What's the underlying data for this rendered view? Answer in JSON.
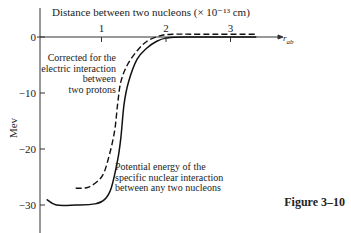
{
  "chart_data": {
    "type": "line",
    "title": "",
    "xlabel": "Distance between two nucleons (× 10⁻¹³ cm)",
    "ylabel": "Mev",
    "x_axis_end_label": "r_ab",
    "xlim": [
      0,
      3.6
    ],
    "ylim": [
      -34,
      2
    ],
    "x_ticks": [
      1,
      2,
      3
    ],
    "x_tick_labels": [
      "1",
      "2",
      "3"
    ],
    "y_ticks": [
      0,
      -10,
      -20,
      -30
    ],
    "y_tick_labels": [
      "0",
      "−10",
      "−20",
      "−30"
    ],
    "grid": false,
    "series": [
      {
        "name": "Potential energy of the specific nuclear interaction between any two nucleons",
        "style": "solid",
        "points": [
          [
            0.15,
            -29
          ],
          [
            0.3,
            -30
          ],
          [
            0.6,
            -30
          ],
          [
            0.9,
            -29.8
          ],
          [
            1.05,
            -29
          ],
          [
            1.15,
            -27
          ],
          [
            1.25,
            -22
          ],
          [
            1.3,
            -18
          ],
          [
            1.35,
            -12
          ],
          [
            1.42,
            -8
          ],
          [
            1.55,
            -4
          ],
          [
            1.7,
            -2
          ],
          [
            1.85,
            -0.8
          ],
          [
            2.0,
            -0.2
          ],
          [
            2.3,
            0
          ],
          [
            3.4,
            0
          ]
        ]
      },
      {
        "name": "Corrected for the electric interaction between two protons",
        "style": "dashed",
        "points": [
          [
            0.6,
            -27
          ],
          [
            0.8,
            -26.8
          ],
          [
            1.0,
            -25
          ],
          [
            1.1,
            -22
          ],
          [
            1.2,
            -17
          ],
          [
            1.25,
            -12
          ],
          [
            1.3,
            -8
          ],
          [
            1.4,
            -5
          ],
          [
            1.55,
            -2.5
          ],
          [
            1.7,
            -0.8
          ],
          [
            1.9,
            0.2
          ],
          [
            2.1,
            0.5
          ],
          [
            2.5,
            0.5
          ],
          [
            3.4,
            0.5
          ]
        ]
      }
    ],
    "annotations": [
      {
        "text_lines": [
          "Corrected for the",
          "electric interaction",
          "between",
          "two protons"
        ],
        "target": "dashed"
      },
      {
        "text_lines": [
          "Potential energy of the",
          "specific nuclear interaction",
          "between any two nucleons"
        ],
        "target": "solid"
      }
    ]
  },
  "figure_label": "Figure 3–10"
}
